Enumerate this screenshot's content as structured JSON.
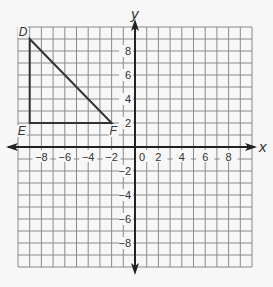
{
  "colors": {
    "background": "#f7f7f7",
    "grid": "#8a8a8a",
    "axis": "#222222",
    "shape": "#333333"
  },
  "axes": {
    "x_label": "x",
    "y_label": "y",
    "x_ticks": [
      {
        "value": -8,
        "label": "−8"
      },
      {
        "value": -6,
        "label": "−6"
      },
      {
        "value": -4,
        "label": "−4"
      },
      {
        "value": -2,
        "label": "−2"
      },
      {
        "value": 0,
        "label": "0"
      },
      {
        "value": 2,
        "label": "2"
      },
      {
        "value": 4,
        "label": "4"
      },
      {
        "value": 6,
        "label": "6"
      },
      {
        "value": 8,
        "label": "8"
      }
    ],
    "y_ticks": [
      {
        "value": 8,
        "label": "8"
      },
      {
        "value": 6,
        "label": "6"
      },
      {
        "value": 4,
        "label": "4"
      },
      {
        "value": 2,
        "label": "2"
      },
      {
        "value": -2,
        "label": "−2"
      },
      {
        "value": -4,
        "label": "−4"
      },
      {
        "value": -6,
        "label": "−6"
      },
      {
        "value": -8,
        "label": "−8"
      }
    ],
    "range": {
      "xmin": -10,
      "xmax": 10,
      "ymin": -10,
      "ymax": 10
    }
  },
  "triangle": {
    "vertices": [
      {
        "name": "D",
        "x": -9,
        "y": 9
      },
      {
        "name": "E",
        "x": -9,
        "y": 2
      },
      {
        "name": "F",
        "x": -2,
        "y": 2
      }
    ]
  }
}
